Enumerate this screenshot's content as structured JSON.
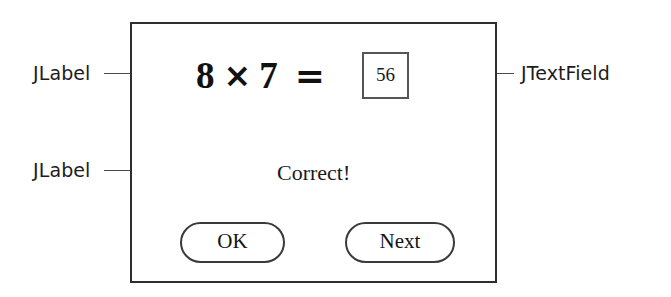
{
  "diagram": {
    "background_color": "#ffffff",
    "line_color": "#3a3a3a"
  },
  "panel": {
    "border_color": "#2e2e2e",
    "background_color": "#ffffff",
    "equation": {
      "left_operand": "8",
      "operator": "×",
      "right_operand": "7",
      "equals": "="
    },
    "answer_field": {
      "value": "56",
      "placeholder": "",
      "border_color": "#555555"
    },
    "feedback_label": {
      "text": "Correct!"
    },
    "buttons": [
      {
        "label": "OK",
        "name": "ok-button"
      },
      {
        "label": "Next",
        "name": "next-button"
      }
    ]
  },
  "annotations": [
    {
      "text": "JLabel",
      "points_to": "equation",
      "direction": "right"
    },
    {
      "text": "JLabel",
      "points_to": "feedback_label",
      "direction": "right"
    },
    {
      "text": "JTextField",
      "points_to": "answer_field",
      "direction": "left"
    }
  ]
}
